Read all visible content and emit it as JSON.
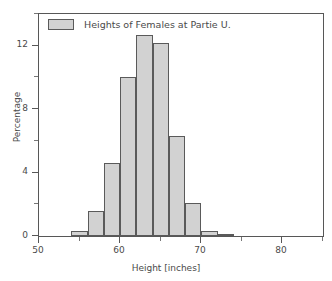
{
  "chart_data": {
    "type": "bar",
    "title": "",
    "xlabel": "Height [inches]",
    "ylabel": "Percentage",
    "xlim": [
      50,
      85
    ],
    "ylim": [
      0,
      14
    ],
    "grid": false,
    "legend_position": "top-left",
    "legend": [
      "Heights of Females at Partie U."
    ],
    "xticks": [
      {
        "value": 50,
        "label": "50",
        "major": true
      },
      {
        "value": 55,
        "label": "",
        "major": false
      },
      {
        "value": 60,
        "label": "60",
        "major": true
      },
      {
        "value": 65,
        "label": "",
        "major": false
      },
      {
        "value": 70,
        "label": "70",
        "major": true
      },
      {
        "value": 75,
        "label": "",
        "major": false
      },
      {
        "value": 80,
        "label": "80",
        "major": true
      },
      {
        "value": 85,
        "label": "",
        "major": false
      }
    ],
    "yticks": [
      {
        "value": 0,
        "label": "0",
        "major": true
      },
      {
        "value": 2,
        "label": "",
        "major": false
      },
      {
        "value": 4,
        "label": "4",
        "major": true
      },
      {
        "value": 6,
        "label": "",
        "major": false
      },
      {
        "value": 8,
        "label": "8",
        "major": true
      },
      {
        "value": 10,
        "label": "",
        "major": false
      },
      {
        "value": 12,
        "label": "12",
        "major": true
      },
      {
        "value": 14,
        "label": "",
        "major": false
      }
    ],
    "bin_width": 2,
    "bins": [
      {
        "x0": 54,
        "x1": 56,
        "value": 0.3
      },
      {
        "x0": 56,
        "x1": 58,
        "value": 1.6
      },
      {
        "x0": 58,
        "x1": 60,
        "value": 4.6
      },
      {
        "x0": 60,
        "x1": 62,
        "value": 10.0
      },
      {
        "x0": 62,
        "x1": 64,
        "value": 12.7
      },
      {
        "x0": 64,
        "x1": 66,
        "value": 12.2
      },
      {
        "x0": 66,
        "x1": 68,
        "value": 6.3
      },
      {
        "x0": 68,
        "x1": 70,
        "value": 2.1
      },
      {
        "x0": 70,
        "x1": 72,
        "value": 0.3
      },
      {
        "x0": 72,
        "x1": 74,
        "value": 0.1
      }
    ],
    "categories": [
      "54-56",
      "56-58",
      "58-60",
      "60-62",
      "62-64",
      "64-66",
      "66-68",
      "68-70",
      "70-72",
      "72-74"
    ],
    "values": [
      0.3,
      1.6,
      4.6,
      10.0,
      12.7,
      12.2,
      6.3,
      2.1,
      0.3,
      0.1
    ],
    "colors": {
      "bar_fill": "#d2d2d2",
      "bar_edge": "#5a5a5a",
      "axis": "#575757",
      "text": "#4a4a4a",
      "background": "#ffffff"
    }
  }
}
